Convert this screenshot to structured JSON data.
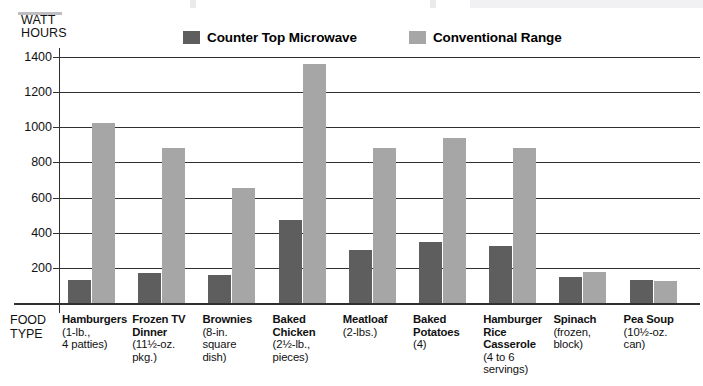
{
  "axis_caption": {
    "line1": "WATT",
    "line2": "HOURS"
  },
  "legend": {
    "items": [
      {
        "label": "Counter Top Microwave",
        "color": "#5e5e5e",
        "key": "microwave"
      },
      {
        "label": "Conventional Range",
        "color": "#a6a6a6",
        "key": "conventional"
      }
    ]
  },
  "food_type_label": {
    "line1": "FOOD",
    "line2": "TYPE"
  },
  "chart_data": {
    "type": "bar",
    "title": "",
    "xlabel": "FOOD TYPE",
    "ylabel": "WATT HOURS",
    "ylim": [
      0,
      1400
    ],
    "ytick_values": [
      1400,
      1200,
      1000,
      800,
      600,
      400,
      200
    ],
    "ytick_labels": [
      "1400",
      "1200",
      "1000",
      "800",
      "600",
      "400",
      "200"
    ],
    "grid": true,
    "legend_position": "top",
    "categories": [
      "Hamburgers",
      "Frozen TV Dinner",
      "Brownies",
      "Baked Chicken",
      "Meatloaf",
      "Baked Potatoes",
      "Hamburger Rice Casserole",
      "Spinach",
      "Pea Soup"
    ],
    "category_details": [
      {
        "name": "Hamburgers",
        "desc_lines": [
          "(1-lb.,",
          "4 patties)"
        ]
      },
      {
        "name": "Frozen TV Dinner",
        "desc_lines": [
          "(11½-oz.",
          "pkg.)"
        ]
      },
      {
        "name": "Brownies",
        "desc_lines": [
          "(8-in.",
          "square",
          "dish)"
        ]
      },
      {
        "name": "Baked Chicken",
        "desc_lines": [
          "(2½-lb.,",
          "pieces)"
        ]
      },
      {
        "name": "Meatloaf",
        "desc_lines": [
          "(2-lbs.)"
        ]
      },
      {
        "name": "Baked Potatoes",
        "desc_lines": [
          "(4)"
        ]
      },
      {
        "name": "Hamburger Rice Casserole",
        "desc_lines": [
          "(4 to 6",
          "servings)"
        ]
      },
      {
        "name": "Spinach",
        "desc_lines": [
          "(frozen,",
          "block)"
        ]
      },
      {
        "name": "Pea Soup",
        "desc_lines": [
          "(10½-oz.",
          "can)"
        ]
      }
    ],
    "series": [
      {
        "name": "Counter Top Microwave",
        "color": "#5e5e5e",
        "values": [
          130,
          170,
          160,
          470,
          300,
          350,
          325,
          150,
          130
        ]
      },
      {
        "name": "Conventional Range",
        "color": "#a6a6a6",
        "values": [
          1025,
          885,
          655,
          1360,
          885,
          940,
          880,
          175,
          125
        ]
      }
    ]
  }
}
